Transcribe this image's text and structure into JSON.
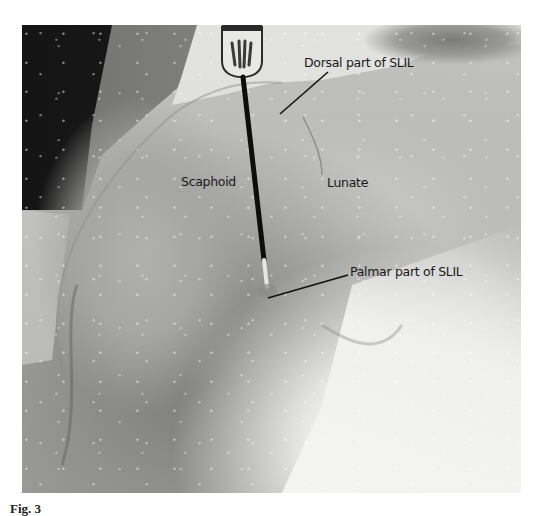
{
  "figure": {
    "type": "anatomical photograph (grayscale)",
    "labels": {
      "dorsal": "Dorsal part of SLIL",
      "scaphoid": "Scaphoid",
      "lunate": "Lunate",
      "palmar": "Palmar part of SLIL"
    },
    "instrument": "probe",
    "caption_cropped": "Fig. 3"
  },
  "colors": {
    "background_page": "#ffffff",
    "dark_background": "#141414",
    "tissue_mid": "#b4b4b2",
    "tissue_light": "#f0f0ef",
    "label_text": "#1a1a1a",
    "probe_shaft": "#0d0d0d"
  }
}
